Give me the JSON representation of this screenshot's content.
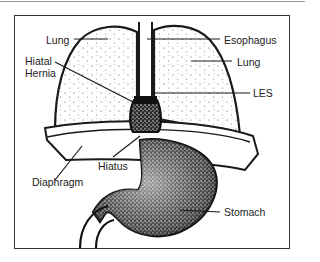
{
  "diagram": {
    "labels": {
      "lung_left": "Lung",
      "esophagus": "Esophagus",
      "lung_right": "Lung",
      "hiatal_hernia_line1": "Hiatal",
      "hiatal_hernia_line2": "Hernia",
      "les": "LES",
      "diaphragm": "Diaphragm",
      "hiatus": "Hiatus",
      "stomach": "Stomach"
    },
    "colors": {
      "ink": "#1a1a1a",
      "border": "#333333",
      "background": "#ffffff",
      "stipple": "#555555"
    }
  }
}
